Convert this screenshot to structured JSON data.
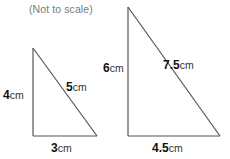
{
  "figure": {
    "note": "(Not to scale)",
    "stroke_color": "#555555",
    "text_color": "#111111",
    "note_color": "#7a7a7a",
    "background": "#ffffff"
  },
  "triangles": [
    {
      "name": "small-triangle",
      "vertices": {
        "apex": [
          33,
          48
        ],
        "bottom_left": [
          33,
          136
        ],
        "bottom_right": [
          97,
          136
        ]
      },
      "labels": {
        "vertical": {
          "num": "4",
          "unit": "cm"
        },
        "hypotenuse": {
          "num": "5",
          "unit": "cm"
        },
        "base": {
          "num": "3",
          "unit": "cm"
        }
      }
    },
    {
      "name": "large-triangle",
      "vertices": {
        "apex": [
          128,
          7
        ],
        "bottom_left": [
          128,
          136
        ],
        "bottom_right": [
          220,
          136
        ]
      },
      "labels": {
        "vertical": {
          "num": "6",
          "unit": "cm"
        },
        "hypotenuse": {
          "num": "7.5",
          "unit": "cm"
        },
        "base": {
          "num": "4.5",
          "unit": "cm"
        }
      }
    }
  ]
}
